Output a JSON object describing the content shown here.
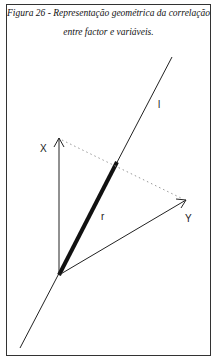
{
  "caption": {
    "line1": "Figura 26 - Representação geométrica da correlação",
    "line2": "entre factor e variáveis."
  },
  "labels": {
    "x": "X",
    "y": "Y",
    "r": "r",
    "l": "l"
  },
  "colors": {
    "line": "#222222",
    "dotted": "#999999"
  }
}
